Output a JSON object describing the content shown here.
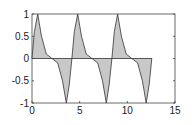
{
  "chart_data": {
    "type": "area",
    "title": "",
    "xlabel": "",
    "ylabel": "",
    "xlim": [
      0,
      15
    ],
    "ylim": [
      -1,
      1
    ],
    "grid": false,
    "x_ticks": [
      "0",
      "5",
      "10",
      "15"
    ],
    "y_ticks": [
      "1",
      "0.5",
      "0",
      "-0.5",
      "-1"
    ],
    "fill_color": "#c8c8c8",
    "line_color": "#333333",
    "series": [
      {
        "name": "y",
        "x": [
          0,
          0.25,
          0.6,
          1.0,
          1.5,
          2.1,
          2.7,
          3.2,
          3.6,
          3.9,
          4.19,
          4.44,
          4.79,
          5.19,
          5.69,
          6.29,
          6.89,
          7.39,
          7.79,
          8.09,
          8.38,
          8.63,
          8.98,
          9.38,
          9.88,
          10.48,
          11.08,
          11.58,
          11.98,
          12.28,
          12.57
        ],
        "y": [
          0,
          0.6,
          1,
          0.5,
          0.1,
          0,
          -0.1,
          -0.5,
          -1,
          -0.6,
          0,
          0.6,
          1,
          0.5,
          0.1,
          0,
          -0.1,
          -0.5,
          -1,
          -0.6,
          0,
          0.6,
          1,
          0.5,
          0.1,
          0,
          -0.1,
          -0.5,
          -1,
          -0.6,
          0
        ]
      }
    ]
  }
}
